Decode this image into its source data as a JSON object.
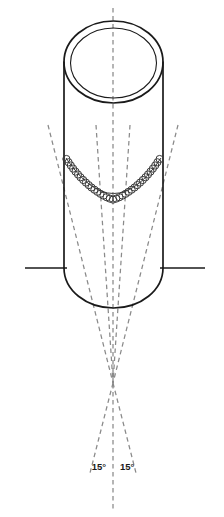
{
  "figure": {
    "title": "Cylindrical vessel elevation with circumferential weld and 15-degree construction angles",
    "background_color": "#ffffff",
    "line_color": "#1a1a1a",
    "dashed_color": "#8a8a8a",
    "weld_color": "#3a3a3a",
    "canvas": {
      "width": 224,
      "height": 517
    }
  },
  "labels": {
    "angle_left": "15°",
    "angle_right": "15°"
  },
  "geometry": {
    "cylinder": {
      "left_x": 64,
      "right_x": 163,
      "top_y": 21,
      "body_bottom_y": 268,
      "cap_bottom_y": 308,
      "outer_ellipse_ry": 41,
      "inner_ellipse_rx": 43,
      "inner_ellipse_ry": 35
    },
    "weld_seam": {
      "start_x": 66,
      "end_x": 161,
      "start_y": 158,
      "sag_y": 204,
      "bead_count": 42,
      "bead_radius": 3.6
    },
    "reference_lines": {
      "y": 268,
      "left_start_x": 25,
      "right_end_x": 205
    },
    "construction": {
      "apex_x": 113,
      "apex_y": 383,
      "center_axis_x": 113,
      "center_top_y": 8,
      "center_bottom_y": 512,
      "left_top_x": 48,
      "left_top_y": 125,
      "right_top_x": 178,
      "right_top_y": 125,
      "left_bottom_x": 90,
      "right_bottom_x": 136,
      "bottom_y": 470,
      "angle_degrees": 15
    }
  }
}
